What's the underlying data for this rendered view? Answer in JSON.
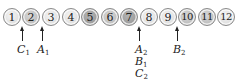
{
  "coins": [
    {
      "n": "1",
      "shade": "light"
    },
    {
      "n": "2",
      "shade": "medium"
    },
    {
      "n": "3",
      "shade": "light"
    },
    {
      "n": "4",
      "shade": "light"
    },
    {
      "n": "5",
      "shade": "dark"
    },
    {
      "n": "6",
      "shade": "medium"
    },
    {
      "n": "7",
      "shade": "dark"
    },
    {
      "n": "8",
      "shade": "light"
    },
    {
      "n": "9",
      "shade": "light"
    },
    {
      "n": "10",
      "shade": "medium"
    },
    {
      "n": "11",
      "shade": "medium"
    },
    {
      "n": "12",
      "shade": "light"
    }
  ],
  "markers": [
    {
      "between": "1-2",
      "labels": [
        {
          "letter": "C",
          "sub": "1"
        }
      ]
    },
    {
      "between": "2-3",
      "labels": [
        {
          "letter": "A",
          "sub": "1"
        }
      ]
    },
    {
      "between": "7-8",
      "labels": [
        {
          "letter": "A",
          "sub": "2"
        },
        {
          "letter": "B",
          "sub": "1"
        },
        {
          "letter": "C",
          "sub": "2"
        }
      ]
    },
    {
      "between": "9-10",
      "labels": [
        {
          "letter": "B",
          "sub": "2"
        }
      ]
    }
  ],
  "colors": {
    "light": "#dedede",
    "medium": "#bdbdbd",
    "dark": "#9a9a9a",
    "ink": "#222222"
  }
}
